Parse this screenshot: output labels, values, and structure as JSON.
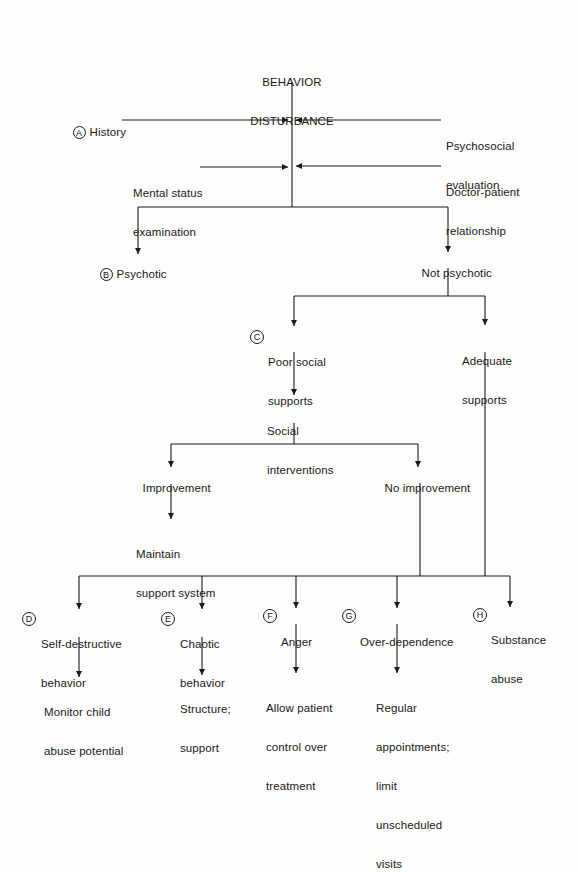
{
  "diagram": {
    "title_line1": "BEHAVIOR",
    "title_line2": "DISTURBANCE",
    "inputs_left": [
      {
        "marker": "A",
        "label": "History"
      },
      {
        "marker": "",
        "label_line1": "Mental status",
        "label_line2": "examination"
      }
    ],
    "inputs_right": [
      {
        "label_line1": "Psychosocial",
        "label_line2": "evaluation"
      },
      {
        "label_line1": "Doctor-patient",
        "label_line2": "relationship"
      }
    ],
    "level1": [
      {
        "marker": "B",
        "label": "Psychotic"
      },
      {
        "marker": "",
        "label": "Not psychotic"
      }
    ],
    "level2": [
      {
        "marker": "C",
        "label_line1": "Poor social",
        "label_line2": "supports"
      },
      {
        "marker": "",
        "label_line1": "Adequate",
        "label_line2": "supports"
      }
    ],
    "social_interventions": {
      "label_line1": "Social",
      "label_line2": "interventions"
    },
    "level3": [
      {
        "label": "Improvement"
      },
      {
        "label": "No improvement"
      }
    ],
    "maintain": {
      "label_line1": "Maintain",
      "label_line2": "support system"
    },
    "problems": [
      {
        "marker": "D",
        "label_line1": "Self-destructive",
        "label_line2": "behavior",
        "action_lines": [
          "Monitor child",
          "abuse potential"
        ]
      },
      {
        "marker": "E",
        "label_line1": "Chaotic",
        "label_line2": "behavior",
        "action_lines": [
          "Structure;",
          "support"
        ]
      },
      {
        "marker": "F",
        "label_line1": "Anger",
        "label_line2": "",
        "action_lines": [
          "Allow patient",
          "control over",
          "treatment"
        ]
      },
      {
        "marker": "G",
        "label_line1": "Over-dependence",
        "label_line2": "",
        "action_lines": [
          "Regular",
          "appointments;",
          "limit",
          "unscheduled",
          "visits"
        ]
      },
      {
        "marker": "H",
        "label_line1": "Substance",
        "label_line2": "abuse",
        "action_lines": []
      }
    ]
  },
  "colors": {
    "line": "#1a1a1a",
    "background": "#fdfdfc"
  }
}
